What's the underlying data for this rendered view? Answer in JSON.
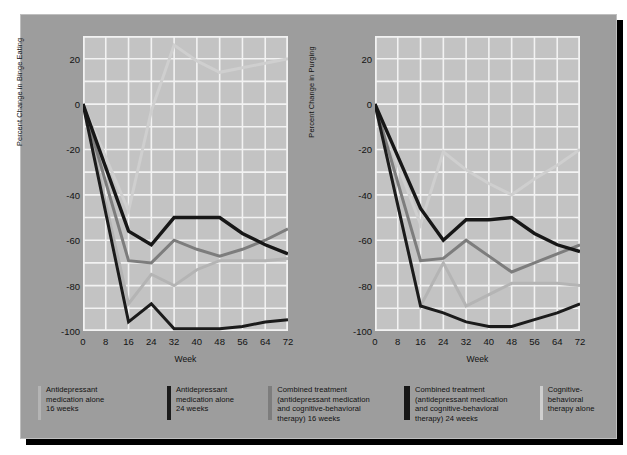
{
  "figure": {
    "background": "#9d9d9d",
    "plot_background": "#c3c3c3",
    "grid_color": "#f2f2f2"
  },
  "charts": [
    {
      "id": "binge-eating",
      "ylabel": "Percent Change in Binge Eating",
      "xlabel": "Week"
    },
    {
      "id": "purging",
      "ylabel": "Percent Change in Purging",
      "xlabel": "Week"
    }
  ],
  "axis": {
    "yticks": [
      "20",
      "0",
      "-20",
      "-40",
      "-60",
      "-80",
      "-100"
    ],
    "xticks": [
      "0",
      "8",
      "16",
      "24",
      "32",
      "40",
      "48",
      "56",
      "64",
      "72"
    ]
  },
  "legend": {
    "items": [
      {
        "color": "#b4b4b4",
        "width": 3,
        "label": "Antidepressant\nmedication alone\n16 weeks"
      },
      {
        "color": "#1b1b1b",
        "width": 4,
        "label": "Antidepressant\nmedication alone\n24 weeks"
      },
      {
        "color": "#7d7d7d",
        "width": 4,
        "label": "Combined treatment\n(antidepressant medication\nand cognitive-behavioral\ntherapy) 16 weeks"
      },
      {
        "color": "#171717",
        "width": 6,
        "label": "Combined treatment\n(antidepressant medication\nand cognitive-behavioral\ntherapy) 24 weeks"
      },
      {
        "color": "#cfcfcf",
        "width": 3,
        "label": "Cognitive-behavioral\ntherapy alone"
      }
    ]
  },
  "chart_data": [
    {
      "type": "line",
      "title": "",
      "xlabel": "Week",
      "ylabel": "Percent Change in Binge Eating",
      "x": [
        0,
        8,
        16,
        24,
        32,
        40,
        48,
        56,
        64,
        72
      ],
      "xlim": [
        0,
        72
      ],
      "ylim": [
        -100,
        30
      ],
      "grid": true,
      "legend_position": "below-figure",
      "series": [
        {
          "name": "Antidepressant medication alone 16 weeks",
          "color": "#b4b4b4",
          "x": [
            0,
            16,
            24,
            32,
            40,
            48,
            56,
            64,
            72
          ],
          "values": [
            0,
            -88,
            -75,
            -80,
            -73,
            -69,
            -69,
            -69,
            -68
          ]
        },
        {
          "name": "Antidepressant medication alone 24 weeks",
          "color": "#1b1b1b",
          "x": [
            0,
            16,
            24,
            32,
            40,
            48,
            56,
            64,
            72
          ],
          "values": [
            0,
            -96,
            -88,
            -99,
            -99,
            -99,
            -98,
            -96,
            -95
          ]
        },
        {
          "name": "Combined treatment (antidepressant medication and cognitive-behavioral therapy) 16 weeks",
          "color": "#7d7d7d",
          "x": [
            0,
            16,
            24,
            32,
            40,
            48,
            56,
            64,
            72
          ],
          "values": [
            0,
            -69,
            -70,
            -60,
            -64,
            -67,
            -64,
            -60,
            -55
          ]
        },
        {
          "name": "Combined treatment (antidepressant medication and cognitive-behavioral therapy) 24 weeks",
          "color": "#171717",
          "x": [
            0,
            16,
            24,
            32,
            40,
            48,
            56,
            64,
            72
          ],
          "values": [
            0,
            -56,
            -62,
            -50,
            -50,
            -50,
            -57,
            -62,
            -66
          ]
        },
        {
          "name": "Cognitive-behavioral therapy alone",
          "color": "#cfcfcf",
          "x": [
            0,
            16,
            24,
            32,
            40,
            48,
            56,
            64,
            72
          ],
          "values": [
            0,
            -47,
            -3,
            26,
            19,
            14,
            16,
            18,
            20
          ]
        }
      ]
    },
    {
      "type": "line",
      "title": "",
      "xlabel": "Week",
      "ylabel": "Percent Change in Purging",
      "x": [
        0,
        8,
        16,
        24,
        32,
        40,
        48,
        56,
        64,
        72
      ],
      "xlim": [
        0,
        72
      ],
      "ylim": [
        -100,
        30
      ],
      "grid": true,
      "legend_position": "below-figure",
      "series": [
        {
          "name": "Antidepressant medication alone 16 weeks",
          "color": "#b4b4b4",
          "x": [
            0,
            16,
            24,
            32,
            40,
            48,
            56,
            64,
            72
          ],
          "values": [
            0,
            -89,
            -70,
            -89,
            -84,
            -79,
            -79,
            -79,
            -80
          ]
        },
        {
          "name": "Antidepressant medication alone 24 weeks",
          "color": "#1b1b1b",
          "x": [
            0,
            16,
            24,
            32,
            40,
            48,
            56,
            64,
            72
          ],
          "values": [
            0,
            -89,
            -92,
            -96,
            -98,
            -98,
            -95,
            -92,
            -88
          ]
        },
        {
          "name": "Combined treatment (antidepressant medication and cognitive-behavioral therapy) 16 weeks",
          "color": "#7d7d7d",
          "x": [
            0,
            16,
            24,
            32,
            40,
            48,
            56,
            64,
            72
          ],
          "values": [
            0,
            -69,
            -68,
            -60,
            -67,
            -74,
            -70,
            -66,
            -62
          ]
        },
        {
          "name": "Combined treatment (antidepressant medication and cognitive-behavioral therapy) 24 weeks",
          "color": "#171717",
          "x": [
            0,
            16,
            24,
            32,
            40,
            48,
            56,
            64,
            72
          ],
          "values": [
            0,
            -46,
            -60,
            -51,
            -51,
            -50,
            -57,
            -62,
            -65
          ]
        },
        {
          "name": "Cognitive-behavioral therapy alone",
          "color": "#cfcfcf",
          "x": [
            0,
            16,
            24,
            32,
            40,
            48,
            56,
            64,
            72
          ],
          "values": [
            0,
            -53,
            -21,
            -29,
            -35,
            -40,
            -33,
            -27,
            -20
          ]
        }
      ]
    }
  ]
}
